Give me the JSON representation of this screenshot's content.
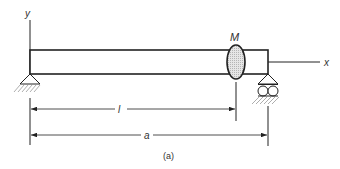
{
  "diagram": {
    "type": "beam-with-point-mass",
    "caption": "(a)",
    "axes": {
      "y_label": "y",
      "x_label": "x"
    },
    "mass": {
      "label": "M"
    },
    "dimensions": [
      {
        "label": "l",
        "from": "left support",
        "to": "mass"
      },
      {
        "label": "a",
        "from": "left support",
        "to": "right support"
      }
    ],
    "supports": [
      {
        "position": "left",
        "kind": "pin"
      },
      {
        "position": "right",
        "kind": "roller"
      }
    ],
    "colors": {
      "line": "#222222",
      "mass_fill": "#cfcfcf",
      "hatch": "#888888"
    }
  }
}
